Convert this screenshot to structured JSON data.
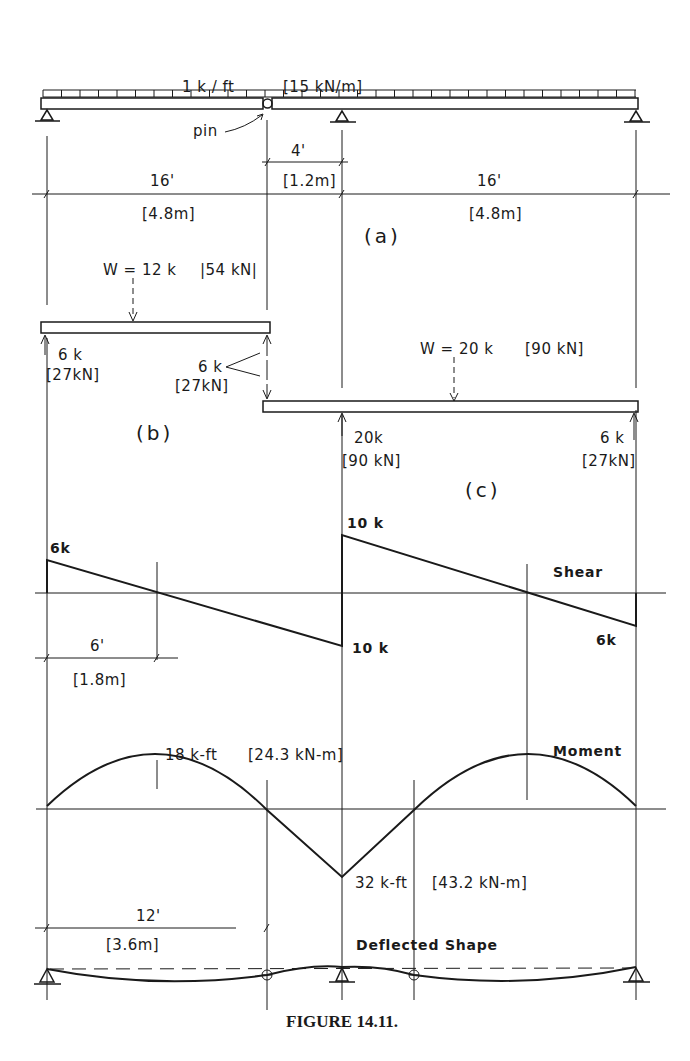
{
  "figure": {
    "caption": "FIGURE 14.11.",
    "part_labels": {
      "a": "(a)",
      "b": "(b)",
      "c": "(c)"
    }
  },
  "part_a": {
    "load_label": "1 k / ft",
    "load_label_si": "[15 kN/m]",
    "pin_label": "pin",
    "dims": {
      "overhang": "4'",
      "overhang_si": "[1.2m]",
      "span_left": "16'",
      "span_left_si": "[4.8m]",
      "span_right": "16'",
      "span_right_si": "[4.8m]"
    }
  },
  "part_b": {
    "load": "W = 12 k",
    "load_si": "|54 kN|",
    "left_reaction": "6 k",
    "left_reaction_si": "[27kN]",
    "pin_reaction": "6 k",
    "pin_reaction_si": "[27kN]"
  },
  "part_c": {
    "load": "W = 20 k",
    "load_si": "[90 kN]",
    "mid_reaction": "20k",
    "mid_reaction_si": "[90 kN]",
    "right_reaction": "6 k",
    "right_reaction_si": "[27kN]"
  },
  "shear": {
    "title": "Shear",
    "left_value": "6k",
    "mid_top_value": "10 k",
    "mid_bottom_value": "10 k",
    "right_value": "6k",
    "zero_dim": "6'",
    "zero_dim_si": "[1.8m]"
  },
  "moment": {
    "title": "Moment",
    "pos_max": "18 k-ft",
    "pos_max_si": "[24.3 kN-m]",
    "neg_max": "32 k-ft",
    "neg_max_si": "[43.2 kN-m]",
    "inflection_dim": "12'",
    "inflection_dim_si": "[3.6m]"
  },
  "deflected": {
    "title": "Deflected Shape"
  }
}
